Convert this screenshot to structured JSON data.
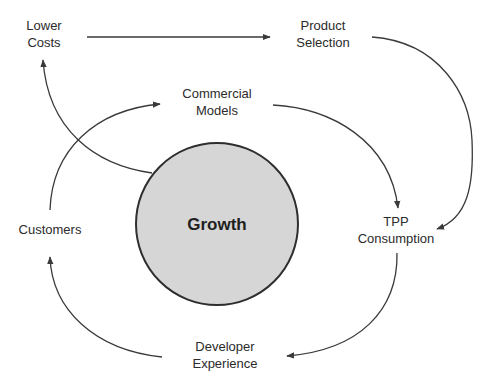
{
  "diagram": {
    "center": {
      "label": "Growth",
      "fill": "#d6d6d6",
      "stroke": "#2e2e2e"
    },
    "nodes": {
      "lower_costs": {
        "line1": "Lower",
        "line2": "Costs"
      },
      "product_selection": {
        "line1": "Product",
        "line2": "Selection"
      },
      "commercial_models": {
        "line1": "Commercial",
        "line2": "Models"
      },
      "customers": {
        "line1": "Customers"
      },
      "tpp_consumption": {
        "line1": "TPP",
        "line2": "Consumption"
      },
      "developer_experience": {
        "line1": "Developer",
        "line2": "Experience"
      }
    },
    "edges": [
      {
        "from": "Lower Costs",
        "to": "Product Selection"
      },
      {
        "from": "Product Selection",
        "to": "TPP Consumption"
      },
      {
        "from": "Commercial Models",
        "to": "TPP Consumption"
      },
      {
        "from": "TPP Consumption",
        "to": "Developer Experience"
      },
      {
        "from": "Developer Experience",
        "to": "Customers"
      },
      {
        "from": "Customers",
        "to": "Commercial Models"
      },
      {
        "from": "Growth",
        "to": "Lower Costs"
      }
    ],
    "colors": {
      "edge": "#3a3a3a",
      "text": "#2b2b2b",
      "background": "#ffffff"
    }
  }
}
